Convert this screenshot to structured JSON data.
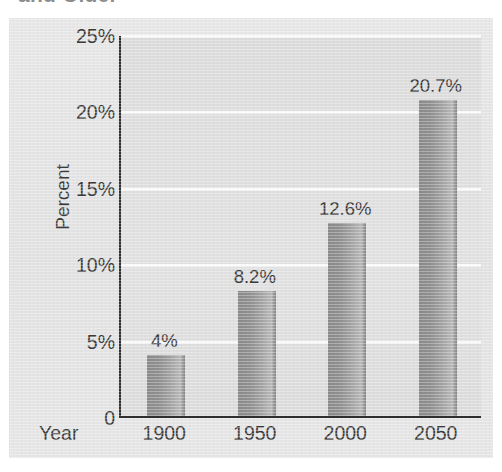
{
  "title": {
    "text": "and Older",
    "note": "cropped at top edge of image"
  },
  "chart_data": {
    "type": "bar",
    "title": "and Older",
    "categories": [
      "1900",
      "1950",
      "2000",
      "2050"
    ],
    "values": [
      4,
      8.2,
      12.6,
      20.7
    ],
    "data_labels": [
      "4%",
      "8.2%",
      "12.6%",
      "20.7%"
    ],
    "xlabel": "Year",
    "ylabel": "Percent",
    "ylim": [
      0,
      25
    ],
    "yticks": [
      0,
      5,
      10,
      15,
      20,
      25
    ],
    "ytick_labels": [
      "0",
      "5%",
      "10%",
      "15%",
      "20%",
      "25%"
    ],
    "grid": true,
    "grid_axis": "y",
    "grid_color": "#fbfbfb",
    "legend": false,
    "bar_color": "#8e8e8e",
    "plot_background": "#dedede",
    "figure_background": "#e4e4e4",
    "axis_color": "#2e2e2e",
    "text_color": "#3a3a3a"
  },
  "axes": {
    "y_title": "Percent",
    "x_title": "Year"
  }
}
